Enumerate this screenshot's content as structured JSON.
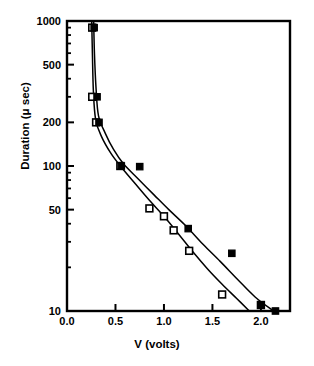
{
  "chart_data": {
    "type": "scatter",
    "title": "",
    "xlabel": "V (volts)",
    "ylabel": "Duration (μ sec)",
    "xlim": [
      0.0,
      2.3
    ],
    "ylim": [
      10,
      1000
    ],
    "yscale": "log",
    "xscale": "linear",
    "grid": false,
    "legend_position": "none",
    "xticks": [
      "0.0",
      "0.5",
      "1.0",
      "1.5",
      "2.0"
    ],
    "xtick_values": [
      0.0,
      0.5,
      1.0,
      1.5,
      2.0
    ],
    "yticks": [
      "1000",
      "500",
      "200",
      "100",
      "50",
      "10"
    ],
    "ytick_values": [
      1000,
      500,
      200,
      100,
      50,
      10
    ],
    "ytick_minor_values": [
      900,
      800,
      700,
      600,
      400,
      300,
      90,
      80,
      70,
      60,
      40,
      30,
      20
    ],
    "series": [
      {
        "name": "open-square",
        "marker": "open-square",
        "color": "#000000",
        "points": [
          {
            "x": 0.26,
            "y": 900
          },
          {
            "x": 0.26,
            "y": 300
          },
          {
            "x": 0.3,
            "y": 200
          },
          {
            "x": 0.55,
            "y": 100
          },
          {
            "x": 0.85,
            "y": 51
          },
          {
            "x": 1.0,
            "y": 45
          },
          {
            "x": 1.1,
            "y": 36
          },
          {
            "x": 1.26,
            "y": 26
          },
          {
            "x": 1.6,
            "y": 13
          },
          {
            "x": 2.0,
            "y": 11
          }
        ]
      },
      {
        "name": "filled-square",
        "marker": "filled-square",
        "color": "#000000",
        "points": [
          {
            "x": 0.28,
            "y": 900
          },
          {
            "x": 0.31,
            "y": 300
          },
          {
            "x": 0.33,
            "y": 200
          },
          {
            "x": 0.56,
            "y": 100
          },
          {
            "x": 0.75,
            "y": 99
          },
          {
            "x": 1.25,
            "y": 37
          },
          {
            "x": 1.7,
            "y": 25
          },
          {
            "x": 2.0,
            "y": 11
          },
          {
            "x": 2.15,
            "y": 10
          }
        ]
      }
    ],
    "curves": [
      {
        "name": "lower-fit-curve",
        "points": [
          {
            "x": 0.255,
            "y": 1000
          },
          {
            "x": 0.262,
            "y": 600
          },
          {
            "x": 0.272,
            "y": 330
          },
          {
            "x": 0.295,
            "y": 210
          },
          {
            "x": 0.355,
            "y": 160
          },
          {
            "x": 0.45,
            "y": 123
          },
          {
            "x": 0.55,
            "y": 100
          },
          {
            "x": 0.7,
            "y": 76
          },
          {
            "x": 0.85,
            "y": 58
          },
          {
            "x": 1.0,
            "y": 45
          },
          {
            "x": 1.15,
            "y": 34
          },
          {
            "x": 1.3,
            "y": 25.5
          },
          {
            "x": 1.45,
            "y": 19.5
          },
          {
            "x": 1.6,
            "y": 15.3
          },
          {
            "x": 1.75,
            "y": 12.2
          },
          {
            "x": 1.88,
            "y": 10.0
          }
        ]
      },
      {
        "name": "upper-fit-curve",
        "points": [
          {
            "x": 0.275,
            "y": 1000
          },
          {
            "x": 0.283,
            "y": 600
          },
          {
            "x": 0.3,
            "y": 340
          },
          {
            "x": 0.325,
            "y": 222
          },
          {
            "x": 0.395,
            "y": 168
          },
          {
            "x": 0.48,
            "y": 130
          },
          {
            "x": 0.58,
            "y": 104
          },
          {
            "x": 0.73,
            "y": 82
          },
          {
            "x": 0.9,
            "y": 63
          },
          {
            "x": 1.05,
            "y": 50
          },
          {
            "x": 1.22,
            "y": 39
          },
          {
            "x": 1.4,
            "y": 29
          },
          {
            "x": 1.58,
            "y": 22
          },
          {
            "x": 1.76,
            "y": 16.5
          },
          {
            "x": 1.94,
            "y": 12.5
          },
          {
            "x": 2.12,
            "y": 10.1
          }
        ]
      }
    ]
  }
}
